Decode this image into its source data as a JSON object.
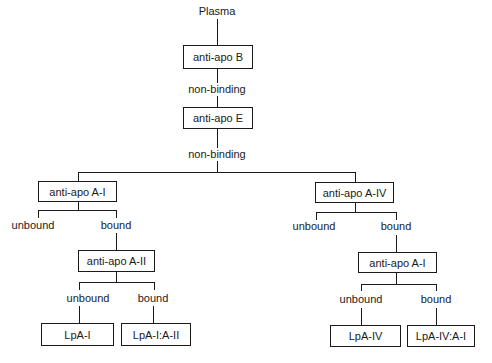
{
  "diagram": {
    "root": "Plasma",
    "steps": {
      "anti_apo_b": "anti-apo B",
      "nonbinding_1": "non-binding",
      "anti_apo_e": "anti-apo E",
      "nonbinding_2": "non-binding"
    },
    "left": {
      "box": "anti-apo A-I",
      "unbound": "unbound",
      "bound": "bound",
      "sub_box": "anti-apo A-II",
      "sub_unbound": "unbound",
      "sub_bound": "bound",
      "leaf_unbound": "LpA-I",
      "leaf_bound": "LpA-I:A-II"
    },
    "right": {
      "box": "anti-apo A-IV",
      "unbound": "unbound",
      "bound": "bound",
      "sub_box": "anti-apo A-I",
      "sub_unbound": "unbound",
      "sub_bound": "bound",
      "leaf_unbound": "LpA-IV",
      "leaf_bound": "LpA-IV:A-I"
    },
    "colors": {
      "line": "#1a1a1a",
      "background": "#ffffff"
    }
  }
}
